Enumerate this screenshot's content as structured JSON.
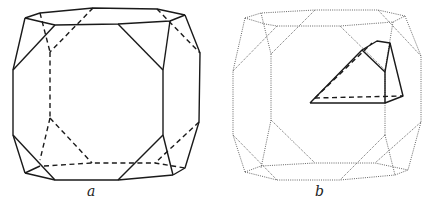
{
  "figures": [
    {
      "id": "a",
      "label": "a",
      "description": "Truncated cube (polyhedron) with hidden edges dashed"
    },
    {
      "id": "b",
      "label": "b",
      "description": "Same truncated cube drawn dotted, with highlighted solid sub-volume"
    }
  ],
  "colors": {
    "line": "#1a1a1a",
    "dotted": "#555555",
    "background": "#ffffff"
  }
}
